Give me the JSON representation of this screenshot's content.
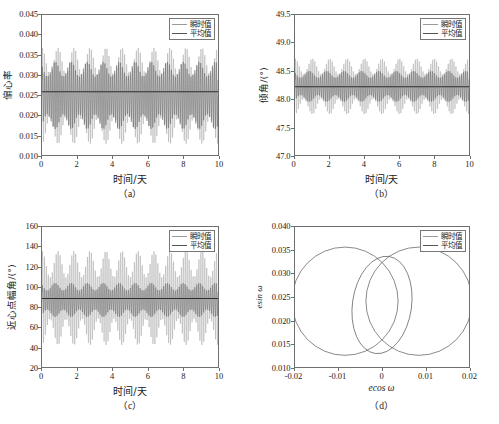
{
  "figure": {
    "panels": [
      "a",
      "b",
      "c",
      "d"
    ],
    "caption_a": "（a）",
    "caption_b": "（b）",
    "caption_c": "（c）",
    "caption_d": "（d）"
  },
  "legend": {
    "instant_label": "瞬时值",
    "mean_label": "平均值",
    "instant_color": "#9a9a9a",
    "mean_color": "#555555"
  },
  "colors": {
    "axis": "#6f6f6f",
    "instant": "#9a9a9a",
    "mean": "#555555",
    "text": "#1a1a1a"
  },
  "chart_data": [
    {
      "panel": "a",
      "type": "line",
      "title": "",
      "xlabel": "时间/天",
      "ylabel": "偏心率",
      "xlim": [
        0,
        10
      ],
      "ylim": [
        0.01,
        0.045
      ],
      "xticks": [
        0,
        2,
        4,
        6,
        8,
        10
      ],
      "xticklabels": [
        "0",
        "2",
        "4",
        "6",
        "8",
        "10"
      ],
      "yticks": [
        0.01,
        0.015,
        0.02,
        0.025,
        0.03,
        0.035,
        0.04,
        0.045
      ],
      "yticklabels": [
        "0.010",
        "0.015",
        "0.020",
        "0.025",
        "0.030",
        "0.035",
        "0.040",
        "0.045"
      ],
      "grid": false,
      "legend_position": "upper right",
      "series": [
        {
          "name": "瞬时值",
          "description": "High-frequency oscillation of eccentricity, envelope between 0.0128 and 0.0368, ~90 orbital cycles over 10 days",
          "envelope_min": 0.0128,
          "envelope_max": 0.0368,
          "cycles": 90,
          "inner_envelope_min": 0.0165,
          "inner_envelope_max": 0.0333,
          "modulation_cycles": 11
        },
        {
          "name": "平均值",
          "description": "Constant mean eccentricity",
          "value": 0.0258
        }
      ]
    },
    {
      "panel": "b",
      "type": "line",
      "title": "",
      "xlabel": "时间/天",
      "ylabel": "倾角/(°)",
      "xlim": [
        0,
        10
      ],
      "ylim": [
        47.0,
        49.5
      ],
      "xticks": [
        0,
        2,
        4,
        6,
        8,
        10
      ],
      "xticklabels": [
        "0",
        "2",
        "4",
        "6",
        "8",
        "10"
      ],
      "yticks": [
        47.0,
        47.5,
        48.0,
        48.5,
        49.0,
        49.5
      ],
      "yticklabels": [
        "47.0",
        "47.5",
        "48.0",
        "48.5",
        "49.0",
        "49.5"
      ],
      "grid": false,
      "legend_position": "upper right",
      "series": [
        {
          "name": "瞬时值",
          "description": "High-frequency oscillation of inclination, envelope between 47.73 and 48.72 deg",
          "envelope_min": 47.73,
          "envelope_max": 48.72,
          "cycles": 90,
          "inner_envelope_min": 47.95,
          "inner_envelope_max": 48.5,
          "modulation_cycles": 10
        },
        {
          "name": "平均值",
          "description": "Constant mean inclination",
          "value": 48.22
        }
      ]
    },
    {
      "panel": "c",
      "type": "line",
      "title": "",
      "xlabel": "时间/天",
      "ylabel": "近心点幅角/(°)",
      "xlim": [
        0,
        10
      ],
      "ylim": [
        20,
        160
      ],
      "xticks": [
        0,
        2,
        4,
        6,
        8,
        10
      ],
      "xticklabels": [
        "0",
        "2",
        "4",
        "6",
        "8",
        "10"
      ],
      "yticks": [
        20,
        40,
        60,
        80,
        100,
        120,
        140,
        160
      ],
      "yticklabels": [
        "20",
        "40",
        "60",
        "80",
        "100",
        "120",
        "140",
        "160"
      ],
      "grid": false,
      "legend_position": "upper right",
      "series": [
        {
          "name": "瞬时值",
          "description": "High-frequency oscillation of argument of perigee, envelope between 42 and 136 deg",
          "envelope_min": 42,
          "envelope_max": 136,
          "cycles": 90,
          "inner_envelope_min": 70,
          "inner_envelope_max": 104,
          "modulation_cycles": 11
        },
        {
          "name": "平均值",
          "description": "Constant mean argument of perigee",
          "value": 88.5
        }
      ]
    },
    {
      "panel": "d",
      "type": "line",
      "title": "",
      "xlabel": "ecos ω",
      "ylabel": "esin ω",
      "xlim": [
        -0.02,
        0.02
      ],
      "ylim": [
        0.01,
        0.04
      ],
      "xticks": [
        -0.02,
        -0.01,
        0,
        0.01,
        0.02
      ],
      "xticklabels": [
        "-0.02",
        "-0.01",
        "0",
        "0.01",
        "0.02"
      ],
      "yticks": [
        0.01,
        0.015,
        0.02,
        0.025,
        0.03,
        0.035,
        0.04
      ],
      "yticklabels": [
        "0.010",
        "0.015",
        "0.020",
        "0.025",
        "0.030",
        "0.035",
        "0.040"
      ],
      "grid": false,
      "legend_position": "upper right",
      "series": [
        {
          "name": "瞬时值",
          "description": "Eccentricity-vector trace forming two large overlapping loops plus an inner loop",
          "loops": [
            {
              "center_x": -0.0085,
              "center_y": 0.0241,
              "rx": 0.0122,
              "ry": 0.0116
            },
            {
              "center_x": 0.0085,
              "center_y": 0.0241,
              "rx": 0.0122,
              "ry": 0.0116
            },
            {
              "center_x": 0.0,
              "center_y": 0.0233,
              "rx": 0.0068,
              "ry": 0.0105,
              "rotation_deg": 8
            }
          ]
        },
        {
          "name": "平均值",
          "description": "Mean eccentricity vector loop (coincident with traces)",
          "value": null
        }
      ]
    }
  ]
}
